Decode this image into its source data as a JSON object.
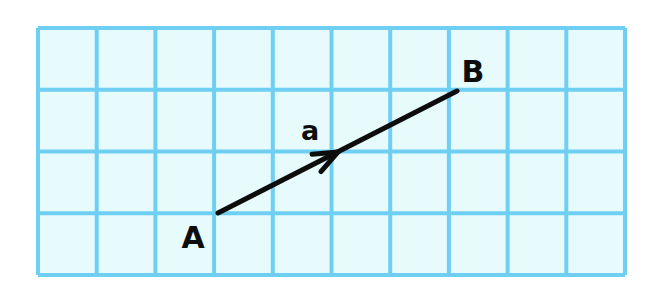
{
  "figure": {
    "background_color": "#ffffff",
    "width": 662,
    "height": 289
  },
  "grid": {
    "fill_color": "#e8fbfc",
    "line_color": "#6ecff3",
    "line_width": 4,
    "origin_x": 38,
    "origin_y": 28,
    "cell_width": 58.7,
    "cell_height": 61.75,
    "columns": 10,
    "rows": 4
  },
  "vector": {
    "name": "a",
    "label": "a",
    "label_x": 310,
    "label_y": 140,
    "color": "#0d0d0d",
    "stroke_width": 5,
    "start_x": 218,
    "start_y": 213,
    "end_x": 457,
    "end_y": 91,
    "arrowhead_x": 338,
    "arrowhead_y": 152,
    "arrowhead_length": 26,
    "arrowhead_half_angle_deg": 22,
    "components_cells": {
      "dx": 4,
      "dy": 2
    }
  },
  "points": [
    {
      "name": "A",
      "label": "A",
      "grid_col": 3,
      "grid_row": 3,
      "anchor_x": 218,
      "anchor_y": 213,
      "label_x": 193,
      "label_y": 248
    },
    {
      "name": "B",
      "label": "B",
      "grid_col": 7,
      "grid_row": 1,
      "anchor_x": 457,
      "anchor_y": 91,
      "label_x": 473,
      "label_y": 82
    }
  ]
}
